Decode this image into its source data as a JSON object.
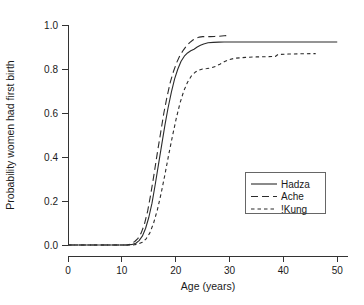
{
  "chart_data": {
    "type": "line",
    "title": "",
    "xlabel": "Age (years)",
    "ylabel": "Probability women had first birth",
    "xlim": [
      0,
      52
    ],
    "ylim": [
      0.0,
      1.0
    ],
    "xticks": [
      0,
      10,
      20,
      30,
      40,
      50
    ],
    "xtick_labels": [
      "0",
      "10",
      "20",
      "30",
      "40",
      "50"
    ],
    "yticks": [
      0.0,
      0.2,
      0.4,
      0.6,
      0.8,
      1.0
    ],
    "ytick_labels": [
      "0.0",
      "0.2",
      "0.4",
      "0.6",
      "0.8",
      "1.0"
    ],
    "grid": false,
    "legend_position": "lower-right",
    "series": [
      {
        "name": "Hadza",
        "style": "solid",
        "dasharray": "none",
        "color": "#2b2b2b",
        "x": [
          0,
          4,
          8,
          11,
          12,
          12.6,
          13.2,
          13.8,
          14.4,
          15,
          15.6,
          16.2,
          16.8,
          17.4,
          18,
          18.6,
          19.2,
          19.8,
          20.4,
          21,
          21.6,
          22.2,
          22.8,
          23.4,
          24,
          24.6,
          25.2,
          26,
          27,
          28,
          29,
          30,
          35,
          40,
          45,
          50
        ],
        "y": [
          0.0,
          0.0,
          0.0,
          0.0,
          0.003,
          0.008,
          0.02,
          0.04,
          0.075,
          0.125,
          0.19,
          0.275,
          0.365,
          0.455,
          0.545,
          0.625,
          0.695,
          0.755,
          0.8,
          0.835,
          0.858,
          0.873,
          0.883,
          0.89,
          0.9,
          0.908,
          0.914,
          0.919,
          0.921,
          0.922,
          0.923,
          0.923,
          0.923,
          0.923,
          0.923,
          0.923
        ]
      },
      {
        "name": "Ache",
        "style": "long-dash",
        "dasharray": "7,4",
        "color": "#2b2b2b",
        "x": [
          0,
          4,
          8,
          11,
          11.8,
          12.4,
          13,
          13.6,
          14.2,
          14.8,
          15.4,
          16,
          16.6,
          17.2,
          17.8,
          18.4,
          19,
          19.6,
          20.2,
          20.8,
          21.4,
          22,
          22.6,
          23.2,
          23.8,
          24.4,
          25,
          25.6,
          26.4,
          27.2,
          28,
          29,
          30
        ],
        "y": [
          0.0,
          0.0,
          0.0,
          0.0,
          0.006,
          0.016,
          0.03,
          0.055,
          0.095,
          0.155,
          0.235,
          0.325,
          0.42,
          0.51,
          0.6,
          0.675,
          0.74,
          0.79,
          0.83,
          0.862,
          0.885,
          0.905,
          0.92,
          0.932,
          0.94,
          0.945,
          0.947,
          0.947,
          0.947,
          0.948,
          0.949,
          0.951,
          0.953
        ]
      },
      {
        "name": "!Kung",
        "style": "short-dash",
        "dasharray": "3.5,3",
        "color": "#2b2b2b",
        "x": [
          0,
          4,
          8,
          12,
          13,
          13.8,
          14.5,
          15.2,
          15.9,
          16.6,
          17.3,
          18,
          18.7,
          19.4,
          20.1,
          20.8,
          21.5,
          22.2,
          22.9,
          23.6,
          24.3,
          25,
          25.8,
          26.6,
          27.4,
          28.2,
          29,
          30,
          31,
          33,
          35,
          37,
          38.5,
          39,
          41,
          43,
          46
        ],
        "y": [
          0.0,
          0.0,
          0.0,
          0.0,
          0.004,
          0.012,
          0.028,
          0.055,
          0.1,
          0.16,
          0.235,
          0.32,
          0.41,
          0.495,
          0.575,
          0.645,
          0.7,
          0.74,
          0.768,
          0.785,
          0.795,
          0.8,
          0.802,
          0.805,
          0.812,
          0.822,
          0.833,
          0.843,
          0.849,
          0.853,
          0.855,
          0.856,
          0.857,
          0.866,
          0.868,
          0.869,
          0.87
        ]
      }
    ]
  },
  "legend": {
    "entries": [
      {
        "label": "Hadza",
        "style": "solid"
      },
      {
        "label": "Ache",
        "style": "long-dash"
      },
      {
        "label": "!Kung",
        "style": "short-dash"
      }
    ]
  },
  "axes": {
    "x_title": "Age (years)",
    "y_title": "Probability women had first birth"
  }
}
